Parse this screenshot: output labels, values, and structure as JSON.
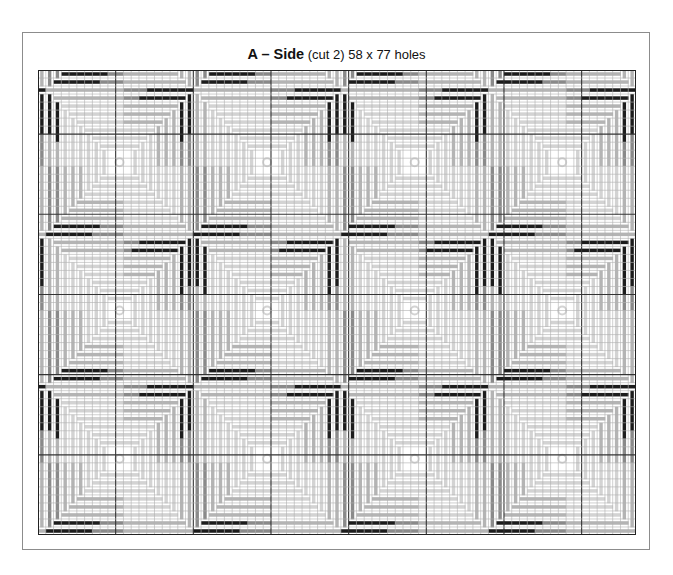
{
  "chart": {
    "title_bold": "A – Side",
    "title_rest": " (cut 2) 58 x 77 holes",
    "cols": 77,
    "rows": 58,
    "bold_every": 10,
    "bold_col_offset": 0,
    "bold_row_offset": 8
  },
  "pattern": {
    "tile_w": 19,
    "tile_h": 18.5,
    "origin_col": 10,
    "origin_row": 11,
    "colors": {
      "black": "#1c1c1c",
      "dark": "#8a8a8a",
      "mid": "#b4b4b4",
      "light": "#d3d3d3",
      "grid": "#b0b0b0",
      "grid_bold": "#333333"
    }
  }
}
